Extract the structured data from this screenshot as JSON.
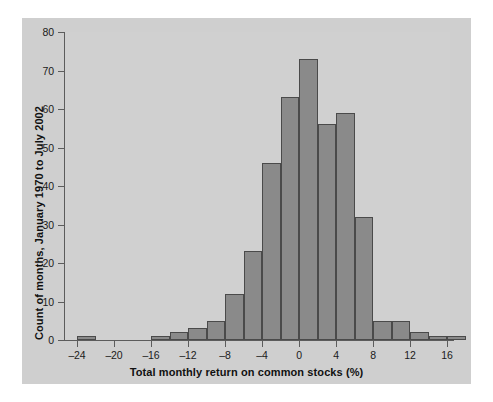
{
  "figure": {
    "background_color": "#cfcfcf",
    "plot_background_color": "#d0d0d0",
    "bar_fill_color": "#8a8a8a",
    "bar_edge_color": "#4a4a4a",
    "axis_color": "#5c5c5c"
  },
  "chart_data": {
    "type": "bar",
    "title": "",
    "subtitle": "",
    "xlabel": "Total monthly return on common stocks (%)",
    "ylabel": "Count of months, January 1970 to July 2002",
    "xlim": [
      -25,
      18
    ],
    "ylim": [
      0,
      80
    ],
    "grid": false,
    "legend": null,
    "bin_width": 2,
    "bin_edges": [
      -24,
      -22,
      -20,
      -18,
      -16,
      -14,
      -12,
      -10,
      -8,
      -6,
      -4,
      -2,
      0,
      2,
      4,
      6,
      8,
      10,
      12,
      14,
      16
    ],
    "categories": [
      "-24 to -22",
      "-22 to -20",
      "-20 to -18",
      "-18 to -16",
      "-16 to -14",
      "-14 to -12",
      "-12 to -10",
      "-10 to -8",
      "-8 to -6",
      "-6 to -4",
      "-4 to -2",
      "-2 to 0",
      "0 to 2",
      "2 to 4",
      "4 to 6",
      "6 to 8",
      "8 to 10",
      "10 to 12",
      "12 to 14",
      "14 to 16",
      "16 to 18"
    ],
    "values": [
      1,
      0,
      0,
      0,
      1,
      2,
      3,
      5,
      12,
      23,
      46,
      63,
      73,
      56,
      59,
      32,
      5,
      5,
      2,
      1,
      1
    ],
    "x_ticks": [
      -24,
      -20,
      -16,
      -12,
      -8,
      -4,
      0,
      4,
      8,
      12,
      16
    ],
    "x_tick_labels": [
      "–24",
      "–20",
      "–16",
      "–12",
      "–8",
      "–4",
      "0",
      "4",
      "8",
      "12",
      "16"
    ],
    "y_ticks": [
      0,
      10,
      20,
      30,
      40,
      50,
      60,
      70,
      80
    ],
    "y_tick_labels": [
      "0",
      "10",
      "20",
      "30",
      "40",
      "50",
      "60",
      "70",
      "80"
    ]
  }
}
